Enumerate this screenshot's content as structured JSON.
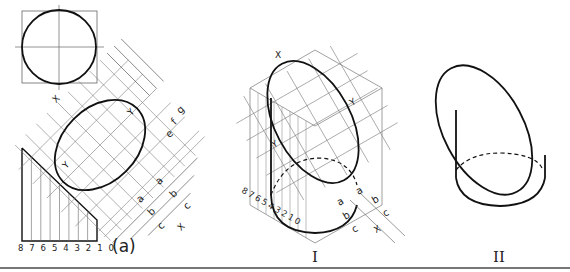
{
  "figure": {
    "labels": {
      "view_a": "(a)",
      "view_I": "I",
      "view_II": "II"
    },
    "scale_front": "8 7 6 5 4 3 2 1 0",
    "scale_iso": [
      "8",
      "7",
      "6",
      "5",
      "4",
      "3",
      "2",
      "1",
      "0"
    ],
    "axis_labels": {
      "x": "X",
      "y": "Y"
    },
    "dimension_labels": {
      "a": "a",
      "b": "b",
      "c": "c",
      "e": "e",
      "f": "f",
      "g": "g"
    },
    "colors": {
      "line": "#222222",
      "thin": "#555555",
      "divider": "#777777"
    }
  }
}
